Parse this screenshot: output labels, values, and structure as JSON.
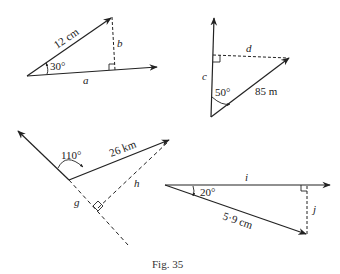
{
  "figure": {
    "caption": "Fig. 35",
    "stroke_color": "#222222",
    "background": "#ffffff"
  },
  "diagrams": [
    {
      "id": "triangle-1",
      "hypotenuse_label": "12 cm",
      "angle_label": "30°",
      "adjacent_label": "a",
      "opposite_label": "b",
      "right_angle_marker": true
    },
    {
      "id": "triangle-2",
      "hypotenuse_label": "85 m",
      "angle_label": "50°",
      "adjacent_label": "c",
      "opposite_label": "d",
      "right_angle_marker": true
    },
    {
      "id": "triangle-3",
      "hypotenuse_label": "26 km",
      "angle_label": "110°",
      "adjacent_label": "g",
      "opposite_label": "h",
      "right_angle_marker": true
    },
    {
      "id": "triangle-4",
      "hypotenuse_label": "5·9 cm",
      "angle_label": "20°",
      "adjacent_label": "i",
      "opposite_label": "j",
      "right_angle_marker": true
    }
  ]
}
